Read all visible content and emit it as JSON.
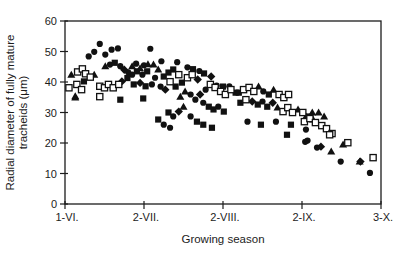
{
  "figure": {
    "background": "#ffffff",
    "ink_color": "#1c1c1c"
  },
  "chart_data": {
    "type": "scatter",
    "title": "",
    "xlabel": "Growing season",
    "ylabel": "Radial diameter of fully mature tracheids (μm)",
    "ylabel_line1": "Radial diameter of fully mature",
    "ylabel_line2": "tracheids (μm)",
    "x_tick_labels": [
      "1-VI.",
      "2-VII.",
      "2-VIII.",
      "2-IX.",
      "3-X."
    ],
    "x_tick_positions": [
      0,
      1,
      2,
      3,
      4
    ],
    "xlim": [
      0,
      4
    ],
    "y_ticks": [
      0,
      10,
      20,
      30,
      40,
      50,
      60
    ],
    "ylim": [
      0,
      60
    ],
    "grid": false,
    "legend_position": "none",
    "frame": "box",
    "marker_color": "#111111",
    "series": [
      {
        "name": "filled-circle",
        "marker": "circle",
        "fill": "#111111",
        "points": [
          [
            0.3,
            48.4
          ],
          [
            0.37,
            49.9
          ],
          [
            0.44,
            52.5
          ],
          [
            0.51,
            49.0
          ],
          [
            0.59,
            50.6
          ],
          [
            0.67,
            51.0
          ],
          [
            1.08,
            50.9
          ],
          [
            0.57,
            45.7
          ],
          [
            0.7,
            45.2
          ],
          [
            0.85,
            42.4
          ],
          [
            0.98,
            42.4
          ],
          [
            0.9,
            46.0
          ],
          [
            1.0,
            45.5
          ],
          [
            0.8,
            43.2
          ],
          [
            1.14,
            41.4
          ],
          [
            1.1,
            39.2
          ],
          [
            1.21,
            38.5
          ],
          [
            1.22,
            46.8
          ],
          [
            1.42,
            46.5
          ],
          [
            1.55,
            44.8
          ],
          [
            1.7,
            43.6
          ],
          [
            1.59,
            35.9
          ],
          [
            1.65,
            34.2
          ],
          [
            1.78,
            37.5
          ],
          [
            1.75,
            33.2
          ],
          [
            1.94,
            31.9
          ],
          [
            1.37,
            28.7
          ],
          [
            1.59,
            28.7
          ],
          [
            1.25,
            26.0
          ],
          [
            1.33,
            25.0
          ],
          [
            1.92,
            38.8
          ],
          [
            2.08,
            38.6
          ],
          [
            2.51,
            36.9
          ],
          [
            2.5,
            33.6
          ],
          [
            2.31,
            27.0
          ],
          [
            2.67,
            27.0
          ],
          [
            3.05,
            24.4
          ],
          [
            3.04,
            20.4
          ],
          [
            3.07,
            20.8
          ],
          [
            3.19,
            18.5
          ],
          [
            3.49,
            13.9
          ],
          [
            3.86,
            10.2
          ]
        ]
      },
      {
        "name": "filled-square",
        "marker": "square",
        "fill": "#111111",
        "points": [
          [
            0.63,
            46.3
          ],
          [
            0.24,
            40.2
          ],
          [
            0.79,
            41.3
          ],
          [
            0.91,
            43.5
          ],
          [
            1.04,
            43.5
          ],
          [
            0.87,
            39.2
          ],
          [
            1.02,
            38.6
          ],
          [
            0.7,
            34.2
          ],
          [
            0.99,
            34.6
          ],
          [
            1.25,
            41.8
          ],
          [
            1.31,
            43.1
          ],
          [
            1.37,
            44.1
          ],
          [
            1.4,
            38.5
          ],
          [
            1.48,
            39.8
          ],
          [
            1.62,
            44.2
          ],
          [
            1.76,
            42.8
          ],
          [
            1.82,
            31.9
          ],
          [
            1.88,
            31.0
          ],
          [
            2.01,
            30.3
          ],
          [
            1.31,
            30.0
          ],
          [
            1.67,
            27.0
          ],
          [
            1.75,
            26.0
          ],
          [
            1.86,
            25.0
          ],
          [
            1.18,
            27.7
          ],
          [
            2.0,
            38.5
          ],
          [
            2.16,
            36.5
          ],
          [
            2.2,
            36.5
          ],
          [
            2.58,
            35.9
          ],
          [
            2.22,
            33.2
          ],
          [
            2.44,
            32.6
          ],
          [
            2.56,
            31.9
          ],
          [
            3.07,
            28.7
          ],
          [
            2.48,
            26.0
          ],
          [
            2.86,
            26.0
          ],
          [
            2.81,
            22.7
          ]
        ]
      },
      {
        "name": "filled-triangle",
        "marker": "triangle",
        "fill": "#111111",
        "points": [
          [
            0.08,
            42.4
          ],
          [
            0.13,
            35.3
          ],
          [
            0.37,
            42.4
          ],
          [
            0.51,
            45.2
          ],
          [
            0.13,
            34.9
          ],
          [
            0.85,
            45.2
          ],
          [
            0.95,
            44.5
          ],
          [
            1.05,
            45.8
          ],
          [
            1.12,
            45.7
          ],
          [
            1.18,
            44.1
          ],
          [
            1.52,
            36.9
          ],
          [
            1.46,
            35.2
          ],
          [
            1.5,
            31.9
          ],
          [
            2.45,
            38.5
          ],
          [
            2.64,
            37.5
          ],
          [
            2.69,
            31.6
          ],
          [
            2.95,
            31.0
          ],
          [
            3.05,
            28.7
          ],
          [
            3.13,
            30.0
          ],
          [
            3.21,
            30.0
          ],
          [
            3.28,
            28.7
          ],
          [
            3.14,
            27.7
          ],
          [
            3.37,
            17.2
          ],
          [
            3.52,
            19.5
          ],
          [
            3.73,
            13.9
          ]
        ]
      },
      {
        "name": "filled-diamond",
        "marker": "diamond",
        "fill": "#111111",
        "points": [
          [
            0.72,
            40.2
          ],
          [
            0.95,
            39.7
          ],
          [
            0.75,
            44.0
          ],
          [
            1.27,
            37.5
          ],
          [
            1.68,
            40.8
          ],
          [
            1.71,
            35.9
          ],
          [
            1.44,
            30.3
          ],
          [
            1.85,
            41.8
          ],
          [
            2.37,
            33.6
          ],
          [
            2.63,
            33.2
          ],
          [
            3.24,
            18.8
          ],
          [
            3.74,
            13.9
          ]
        ]
      },
      {
        "name": "open-square",
        "marker": "square",
        "fill": "#ffffff",
        "stroke": "#111111",
        "points": [
          [
            0.05,
            38.1
          ],
          [
            0.16,
            43.3
          ],
          [
            0.22,
            44.3
          ],
          [
            0.26,
            42.7
          ],
          [
            0.32,
            41.6
          ],
          [
            0.15,
            39.2
          ],
          [
            0.21,
            37.5
          ],
          [
            0.44,
            38.6
          ],
          [
            0.5,
            38.1
          ],
          [
            0.55,
            39.2
          ],
          [
            0.61,
            38.1
          ],
          [
            0.68,
            39.2
          ],
          [
            0.44,
            35.2
          ],
          [
            1.33,
            40.1
          ],
          [
            1.44,
            42.4
          ],
          [
            1.55,
            41.4
          ],
          [
            1.61,
            42.4
          ],
          [
            1.84,
            39.2
          ],
          [
            1.9,
            38.2
          ],
          [
            1.97,
            36.9
          ],
          [
            2.03,
            35.9
          ],
          [
            2.1,
            37.5
          ],
          [
            2.26,
            37.5
          ],
          [
            2.33,
            38.2
          ],
          [
            2.39,
            36.9
          ],
          [
            2.29,
            34.2
          ],
          [
            2.71,
            35.9
          ],
          [
            2.77,
            34.9
          ],
          [
            2.83,
            35.9
          ],
          [
            2.76,
            30.3
          ],
          [
            2.82,
            31.6
          ],
          [
            2.88,
            30.0
          ],
          [
            3.01,
            30.0
          ],
          [
            3.03,
            27.0
          ],
          [
            3.1,
            28.0
          ],
          [
            3.17,
            26.7
          ],
          [
            3.25,
            25.7
          ],
          [
            3.31,
            24.7
          ],
          [
            3.38,
            23.1
          ],
          [
            3.35,
            22.7
          ],
          [
            3.58,
            20.1
          ],
          [
            3.9,
            15.2
          ]
        ]
      }
    ]
  }
}
